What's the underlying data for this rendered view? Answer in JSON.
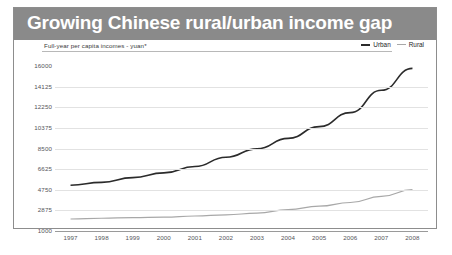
{
  "header": {
    "title": "Growing Chinese rural/urban income gap"
  },
  "chart_data": {
    "type": "line",
    "title": "Growing Chinese rural/urban income gap",
    "subtitle": "Full-year per capita incomes - yuan*",
    "xlabel": "",
    "ylabel": "",
    "grid": true,
    "legend_position": "top-right",
    "x": [
      "1997",
      "1998",
      "1999",
      "2000",
      "2001",
      "2002",
      "2003",
      "2004",
      "2005",
      "2006",
      "2007",
      "2008"
    ],
    "categories": [
      "1997",
      "1998",
      "1999",
      "2000",
      "2001",
      "2002",
      "2003",
      "2004",
      "2005",
      "2006",
      "2007",
      "2008"
    ],
    "ylim": [
      1000,
      16000
    ],
    "yticks": [
      16000,
      14125,
      12250,
      10375,
      8500,
      6625,
      4750,
      2875,
      1000
    ],
    "ytick_labels": [
      "16000",
      "14125",
      "12250",
      "10375",
      "8500",
      "6625",
      "4750",
      "2875",
      "1000"
    ],
    "series": [
      {
        "name": "Urban",
        "color": "#2b2b2b",
        "width": 1.6,
        "values": [
          5160,
          5425,
          5855,
          6280,
          6860,
          7700,
          8470,
          9420,
          10490,
          11760,
          13790,
          15780
        ]
      },
      {
        "name": "Rural",
        "color": "#a8a8a8",
        "width": 1.2,
        "values": [
          2090,
          2160,
          2210,
          2255,
          2365,
          2475,
          2620,
          2940,
          3255,
          3590,
          4140,
          4760
        ]
      }
    ]
  },
  "legend": {
    "urban_label": "Urban",
    "rural_label": "Rural"
  },
  "colors": {
    "title_bar": "#8a8a8a",
    "title_text": "#ffffff",
    "urban": "#2b2b2b",
    "rural": "#a8a8a8",
    "grid": "#e2e2e2",
    "frame": "#8d8d8d"
  }
}
